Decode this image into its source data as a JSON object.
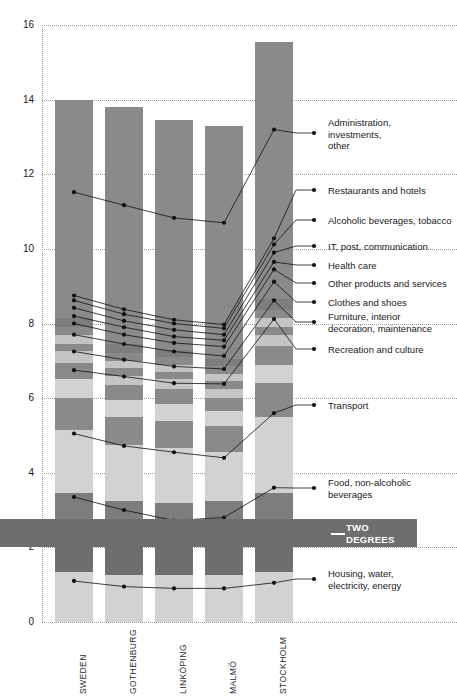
{
  "chart_data": {
    "type": "bar",
    "subtype": "stacked-bar-with-connector-lines",
    "title": "",
    "xlabel": "",
    "ylabel": "",
    "ylim": [
      0,
      16
    ],
    "yticks": [
      0,
      2,
      4,
      6,
      8,
      10,
      12,
      14,
      16
    ],
    "ytick_labels": [
      "0",
      "2",
      "4",
      "6",
      "8",
      "10",
      "12",
      "14",
      "16"
    ],
    "grid": "horizontal-dotted",
    "legend": "inline-callouts-right",
    "categories": [
      "SWEDEN",
      "GOTHENBURG",
      "LINKÖPING",
      "MALMÖ",
      "STOCKHOLM"
    ],
    "totals": [
      14.1,
      13.8,
      13.45,
      13.3,
      15.55
    ],
    "series": [
      {
        "name": "Housing, water, electricity, energy",
        "shade": "#d2d2d2",
        "values": [
          1.35,
          1.25,
          1.25,
          1.25,
          1.35
        ]
      },
      {
        "name": "TWO DEGREES GOAL band",
        "shade": "#6e6e6e",
        "values": [
          0.75,
          0.75,
          0.75,
          0.75,
          0.75
        ]
      },
      {
        "name": "Food, non-alcoholic beverages",
        "shade": "#7d7d7d",
        "values": [
          1.35,
          1.25,
          1.2,
          1.25,
          1.35
        ]
      },
      {
        "name": "Transport",
        "shade": "#d2d2d2",
        "values": [
          1.7,
          1.5,
          1.45,
          1.3,
          2.05
        ]
      },
      {
        "name": "Recreation and culture",
        "shade": "#8a8a8a",
        "values": [
          0.85,
          0.75,
          0.75,
          0.7,
          0.9
        ]
      },
      {
        "name": "Furniture, interior decoration, maintenance",
        "shade": "#d2d2d2",
        "values": [
          0.5,
          0.45,
          0.45,
          0.4,
          0.5
        ]
      },
      {
        "name": "Clothes and shoes",
        "shade": "#8a8a8a",
        "values": [
          0.45,
          0.4,
          0.4,
          0.35,
          0.5
        ]
      },
      {
        "name": "Other products and services",
        "shade": "#c4c4c4",
        "values": [
          0.3,
          0.25,
          0.25,
          0.25,
          0.3
        ]
      },
      {
        "name": "Health care",
        "shade": "#8a8a8a",
        "values": [
          0.2,
          0.2,
          0.2,
          0.2,
          0.2
        ]
      },
      {
        "name": "IT, post, communication",
        "shade": "#c4c4c4",
        "values": [
          0.25,
          0.2,
          0.2,
          0.2,
          0.25
        ]
      },
      {
        "name": "Alcoholic beverages, tobacco",
        "shade": "#8a8a8a",
        "values": [
          0.2,
          0.2,
          0.2,
          0.2,
          0.2
        ]
      },
      {
        "name": "Restaurants and hotels",
        "shade": "#7d7d7d",
        "values": [
          0.25,
          0.25,
          0.2,
          0.2,
          0.3
        ]
      },
      {
        "name": "Administration, investments, other",
        "shade": "#8a8a8a",
        "values": [
          5.85,
          6.35,
          6.15,
          6.25,
          6.9
        ]
      }
    ],
    "connector_series": [
      {
        "name": "Administration, investments, other",
        "points": [
          11.52,
          11.17,
          10.83,
          10.7,
          13.2
        ]
      },
      {
        "name": "Restaurants and hotels",
        "points": [
          8.75,
          8.38,
          8.1,
          7.97,
          10.28
        ]
      },
      {
        "name": "Alcoholic beverages, tobacco",
        "points": [
          8.62,
          8.25,
          8.0,
          7.87,
          10.12
        ]
      },
      {
        "name": "IT, post, communication",
        "points": [
          8.42,
          8.07,
          7.83,
          7.7,
          9.9
        ]
      },
      {
        "name": "Health care",
        "points": [
          8.2,
          7.9,
          7.65,
          7.55,
          9.65
        ]
      },
      {
        "name": "Other products and services",
        "points": [
          8.0,
          7.7,
          7.48,
          7.38,
          9.45
        ]
      },
      {
        "name": "Clothes and shoes",
        "points": [
          7.7,
          7.45,
          7.25,
          7.13,
          9.12
        ]
      },
      {
        "name": "Furniture, interior decoration, maintenance",
        "points": [
          7.25,
          7.03,
          6.85,
          6.78,
          8.62
        ]
      },
      {
        "name": "Recreation and culture",
        "points": [
          6.75,
          6.58,
          6.4,
          6.38,
          8.12
        ]
      },
      {
        "name": "Transport",
        "points": [
          5.05,
          4.72,
          4.55,
          4.4,
          5.6
        ]
      },
      {
        "name": "Food, non-alcoholic beverages",
        "points": [
          3.35,
          3.0,
          2.72,
          2.8,
          3.6
        ]
      },
      {
        "name": "Housing, water, electricity, energy",
        "points": [
          1.1,
          0.95,
          0.9,
          0.9,
          1.05
        ]
      }
    ],
    "callouts": [
      {
        "label": "Administration,\ninvestments,\nother",
        "x": 328,
        "y": 117,
        "dot_x": 314,
        "dot_y": 133
      },
      {
        "label": "Restaurants and hotels",
        "x": 328,
        "y": 185,
        "dot_x": 314,
        "dot_y": 190
      },
      {
        "label": "Alcoholic beverages, tobacco",
        "x": 328,
        "y": 215,
        "dot_x": 314,
        "dot_y": 220
      },
      {
        "label": "IT, post, communication",
        "x": 328,
        "y": 241,
        "dot_x": 314,
        "dot_y": 246
      },
      {
        "label": "Health care",
        "x": 328,
        "y": 260,
        "dot_x": 314,
        "dot_y": 265
      },
      {
        "label": "Other products and services",
        "x": 328,
        "y": 278,
        "dot_x": 314,
        "dot_y": 283
      },
      {
        "label": "Clothes and shoes",
        "x": 328,
        "y": 297,
        "dot_x": 314,
        "dot_y": 302
      },
      {
        "label": "Furniture, interior\ndecoration, maintenance",
        "x": 328,
        "y": 311,
        "dot_x": 314,
        "dot_y": 322
      },
      {
        "label": "Recreation and culture",
        "x": 328,
        "y": 344,
        "dot_x": 314,
        "dot_y": 349
      },
      {
        "label": "Transport",
        "x": 328,
        "y": 400,
        "dot_x": 314,
        "dot_y": 405
      },
      {
        "label": "Food, non-alcoholic\nbeverages",
        "x": 328,
        "y": 477,
        "dot_x": 314,
        "dot_y": 488
      },
      {
        "label": "Housing, water,\nelectricity, energy",
        "x": 328,
        "y": 568,
        "dot_x": 314,
        "dot_y": 579
      }
    ],
    "goal_band": {
      "line1": "TWO DEGREES",
      "line2": "GOAL",
      "y_from": 2.0,
      "y_to": 2.75
    },
    "colors": {
      "dark_gray": "#6e6e6e",
      "mid_gray": "#8a8a8a",
      "light_gray": "#d2d2d2",
      "grid": "#9a9a9a",
      "text": "#1a1a1a",
      "goal_text": "#ffffff"
    }
  }
}
